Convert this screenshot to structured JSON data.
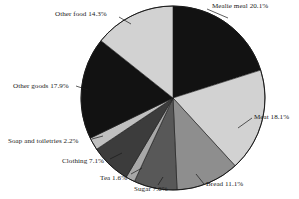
{
  "chart_data": {
    "type": "pie",
    "title": "",
    "subtitle": "",
    "xlabel": "",
    "ylabel": "",
    "legend_position": "none",
    "grid": false,
    "units": "percent",
    "start_angle_deg": 0,
    "direction": "clockwise",
    "categories": [
      "Mealie meal",
      "Meat",
      "Bread",
      "Sugar",
      "Tea",
      "Clothing",
      "Soap and toiletries",
      "Other goods",
      "Other food"
    ],
    "values": [
      20.1,
      18.1,
      11.1,
      7.6,
      1.6,
      7.1,
      2.2,
      17.9,
      14.3
    ],
    "slices": [
      {
        "label": "Mealie meal",
        "value": 20.1,
        "label_text": "Mealie meal 20.1%",
        "color": "#121212"
      },
      {
        "label": "Meat",
        "value": 18.1,
        "label_text": "Meat 18.1%",
        "color": "#d2d2d2"
      },
      {
        "label": "Bread",
        "value": 11.1,
        "label_text": "Bread 11.1%",
        "color": "#8e8e8e"
      },
      {
        "label": "Sugar",
        "value": 7.6,
        "label_text": "Sugar 7.6%",
        "color": "#585858"
      },
      {
        "label": "Tea",
        "value": 1.6,
        "label_text": "Tea 1.6%",
        "color": "#a8a8a8"
      },
      {
        "label": "Clothing",
        "value": 7.1,
        "label_text": "Clothing 7.1%",
        "color": "#3c3c3c"
      },
      {
        "label": "Soap and toiletries",
        "value": 2.2,
        "label_text": "Soap and toiletries 2.2%",
        "color": "#c0c0c0"
      },
      {
        "label": "Other goods",
        "value": 17.9,
        "label_text": "Other goods 17.9%",
        "color": "#121212"
      },
      {
        "label": "Other food",
        "value": 14.3,
        "label_text": "Other food 14.3%",
        "color": "#d2d2d2"
      }
    ]
  },
  "labels": {
    "mealie_meal": "Mealie meal 20.1%",
    "meat": "Meat 18.1%",
    "bread": "Bread 11.1%",
    "sugar": "Sugar 7.6%",
    "tea": "Tea 1.6%",
    "clothing": "Clothing 7.1%",
    "soap_and_toiletries": "Soap and toiletries 2.2%",
    "other_goods": "Other goods 17.9%",
    "other_food": "Other food 14.3%"
  },
  "colors": {
    "background": "#ffffff",
    "outline": "#1a1a1a",
    "text": "#1a1a1a",
    "black_slice": "#121212",
    "light_gray_slice": "#d2d2d2",
    "mid_gray_slice": "#8e8e8e",
    "dark_gray_slice": "#585858",
    "darker_gray_slice": "#3c3c3c",
    "pale_gray_slice": "#c0c0c0",
    "sliver_gray_slice": "#a8a8a8"
  }
}
